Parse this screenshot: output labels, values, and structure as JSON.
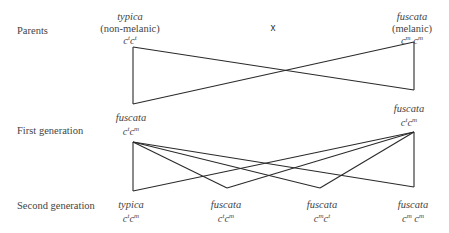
{
  "rows": {
    "parents": "Parents",
    "first": "First generation",
    "second": "Second generation"
  },
  "cross_symbol": "x",
  "parents": {
    "left": {
      "name": "typica",
      "desc": "(non-melanic)",
      "allele1": "t",
      "allele2": "t"
    },
    "right": {
      "name": "fuscata",
      "desc": "(melanic)",
      "allele1": "m",
      "allele2": "m"
    }
  },
  "first_generation": {
    "left": {
      "name": "fuscata",
      "allele1": "t",
      "allele2": "m"
    },
    "right": {
      "name": "fuscata",
      "allele1": "t",
      "allele2": "m"
    }
  },
  "second_generation": [
    {
      "name": "typica",
      "allele1": "t",
      "allele2": "m"
    },
    {
      "name": "fuscata",
      "allele1": "t",
      "allele2": "m"
    },
    {
      "name": "fuscata",
      "allele1": "m",
      "allele2": "t"
    },
    {
      "name": "fuscata",
      "allele1": "m",
      "allele2": "m"
    }
  ],
  "gene_letter": "c"
}
